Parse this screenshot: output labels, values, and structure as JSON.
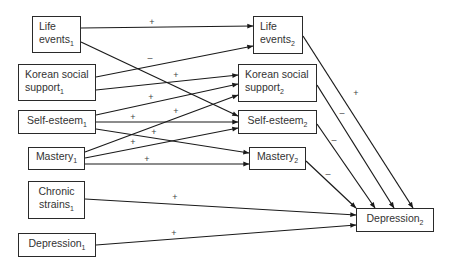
{
  "nodes": [
    {
      "id": "life1",
      "lines": [
        "Life",
        "events"
      ],
      "sub": "1",
      "x": 32,
      "y": 16,
      "w": 49,
      "h": 37,
      "align": "left"
    },
    {
      "id": "korean1",
      "lines": [
        "Korean social",
        "support"
      ],
      "sub": "1",
      "x": 18,
      "y": 64,
      "w": 78,
      "h": 37,
      "align": "left"
    },
    {
      "id": "self1",
      "lines": [
        "Self-esteem"
      ],
      "sub": "1",
      "x": 18,
      "y": 110,
      "w": 78,
      "h": 24,
      "align": "center"
    },
    {
      "id": "mastery1",
      "lines": [
        "Mastery"
      ],
      "sub": "1",
      "x": 28,
      "y": 147,
      "w": 57,
      "h": 23,
      "align": "center"
    },
    {
      "id": "chronic1",
      "lines": [
        "Chronic",
        "strains"
      ],
      "sub": "1",
      "x": 28,
      "y": 181,
      "w": 57,
      "h": 38,
      "align": "center"
    },
    {
      "id": "depression1",
      "lines": [
        "Depression"
      ],
      "sub": "1",
      "x": 18,
      "y": 233,
      "w": 78,
      "h": 24,
      "align": "center"
    },
    {
      "id": "life2",
      "lines": [
        "Life",
        "events"
      ],
      "sub": "2",
      "x": 253,
      "y": 16,
      "w": 50,
      "h": 38,
      "align": "left"
    },
    {
      "id": "korean2",
      "lines": [
        "Korean social",
        "support"
      ],
      "sub": "2",
      "x": 238,
      "y": 64,
      "w": 79,
      "h": 38,
      "align": "left"
    },
    {
      "id": "self2",
      "lines": [
        "Self-esteem"
      ],
      "sub": "2",
      "x": 238,
      "y": 110,
      "w": 79,
      "h": 24,
      "align": "center"
    },
    {
      "id": "mastery2",
      "lines": [
        "Mastery"
      ],
      "sub": "2",
      "x": 249,
      "y": 147,
      "w": 57,
      "h": 23,
      "align": "center"
    },
    {
      "id": "depression2",
      "lines": [
        "Depression"
      ],
      "sub": "2",
      "x": 356,
      "y": 208,
      "w": 78,
      "h": 24,
      "align": "center"
    }
  ],
  "edges": [
    {
      "from": "life1",
      "to": "life2",
      "x1": 81,
      "y1": 28,
      "x2": 253,
      "y2": 26,
      "sign": "+",
      "lx": 152,
      "ly": 22
    },
    {
      "from": "life1",
      "to": "self2",
      "x1": 81,
      "y1": 42,
      "x2": 238,
      "y2": 116,
      "sign": "",
      "lx": 0,
      "ly": 0
    },
    {
      "from": "korean1",
      "to": "life2",
      "x1": 96,
      "y1": 77,
      "x2": 253,
      "y2": 46,
      "sign": "–",
      "lx": 150,
      "ly": 58
    },
    {
      "from": "korean1",
      "to": "korean2",
      "x1": 96,
      "y1": 90,
      "x2": 238,
      "y2": 75,
      "sign": "+",
      "lx": 176,
      "ly": 75
    },
    {
      "from": "self1",
      "to": "korean2",
      "x1": 96,
      "y1": 115,
      "x2": 238,
      "y2": 84,
      "sign": "+",
      "lx": 151,
      "ly": 97
    },
    {
      "from": "self1",
      "to": "self2",
      "x1": 96,
      "y1": 122,
      "x2": 238,
      "y2": 122,
      "sign": "+",
      "lx": 133,
      "ly": 117
    },
    {
      "from": "self1",
      "to": "mastery2",
      "x1": 96,
      "y1": 129,
      "x2": 249,
      "y2": 153,
      "sign": "+",
      "lx": 154,
      "ly": 132
    },
    {
      "from": "mastery1",
      "to": "korean2",
      "x1": 85,
      "y1": 152,
      "x2": 238,
      "y2": 95,
      "sign": "+",
      "lx": 176,
      "ly": 111
    },
    {
      "from": "mastery1",
      "to": "self2",
      "x1": 85,
      "y1": 158,
      "x2": 238,
      "y2": 128,
      "sign": "+",
      "lx": 133,
      "ly": 142
    },
    {
      "from": "mastery1",
      "to": "mastery2",
      "x1": 85,
      "y1": 164,
      "x2": 249,
      "y2": 164,
      "sign": "+",
      "lx": 147,
      "ly": 159
    },
    {
      "from": "chronic1",
      "to": "depression2",
      "x1": 85,
      "y1": 199,
      "x2": 356,
      "y2": 215,
      "sign": "+",
      "lx": 175,
      "ly": 197
    },
    {
      "from": "depression1",
      "to": "depression2",
      "x1": 96,
      "y1": 245,
      "x2": 356,
      "y2": 225,
      "sign": "+",
      "lx": 174,
      "ly": 233
    },
    {
      "from": "life2",
      "to": "depression2",
      "x1": 303,
      "y1": 36,
      "x2": 413,
      "y2": 208,
      "sign": "+",
      "lx": 356,
      "ly": 93
    },
    {
      "from": "korean2",
      "to": "depression2",
      "x1": 317,
      "y1": 85,
      "x2": 394,
      "y2": 208,
      "sign": "–",
      "lx": 342,
      "ly": 113
    },
    {
      "from": "self2",
      "to": "depression2",
      "x1": 317,
      "y1": 124,
      "x2": 375,
      "y2": 208,
      "sign": "–",
      "lx": 334,
      "ly": 140
    },
    {
      "from": "mastery2",
      "to": "depression2",
      "x1": 306,
      "y1": 161,
      "x2": 356,
      "y2": 208,
      "sign": "–",
      "lx": 328,
      "ly": 174
    }
  ],
  "colors": {
    "line": "#1a1a1a",
    "text": "#333333"
  }
}
